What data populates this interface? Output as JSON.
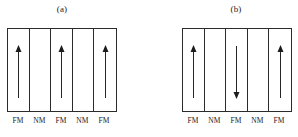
{
  "figure": {
    "background_color": "#ffffff",
    "line_color": "#2b2b2b",
    "arrow_color": "#1c1c1c"
  },
  "panels": [
    {
      "caption": "(a)",
      "layers": [
        {
          "label": "FM",
          "type": "fm",
          "arrow": "up"
        },
        {
          "label": "NM",
          "type": "nm",
          "arrow": "none"
        },
        {
          "label": "FM",
          "type": "fm",
          "arrow": "up"
        },
        {
          "label": "NM",
          "type": "nm",
          "arrow": "none"
        },
        {
          "label": "FM",
          "type": "fm",
          "arrow": "up"
        }
      ]
    },
    {
      "caption": "(b)",
      "layers": [
        {
          "label": "FM",
          "type": "fm",
          "arrow": "up"
        },
        {
          "label": "NM",
          "type": "nm",
          "arrow": "none"
        },
        {
          "label": "FM",
          "type": "fm",
          "arrow": "down"
        },
        {
          "label": "NM",
          "type": "nm",
          "arrow": "none"
        },
        {
          "label": "FM",
          "type": "fm",
          "arrow": "up"
        }
      ]
    }
  ]
}
